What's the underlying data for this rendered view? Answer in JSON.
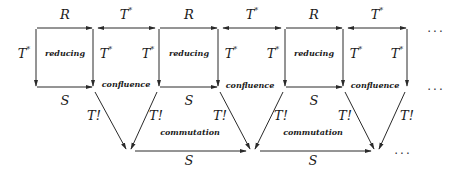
{
  "diagram": {
    "type": "commutative-diagram",
    "colors": {
      "line": "#2a2a2a",
      "background": "#ffffff"
    },
    "labels": {
      "R": "R",
      "S": "S",
      "T_star": "T",
      "star": "*",
      "T_bang": "T!",
      "reducing": "reducing",
      "confluence": "confluence",
      "commutation": "commutation",
      "ellipsis": "..."
    },
    "top_row": [
      "R",
      "T*",
      "R",
      "T*",
      "R",
      "T*",
      "..."
    ],
    "middle_row": [
      "S",
      "S",
      "S",
      "..."
    ],
    "bottom_row": [
      "S",
      "S",
      "..."
    ],
    "regions": [
      "reducing",
      "confluence",
      "reducing",
      "confluence",
      "reducing",
      "confluence",
      "commutation",
      "commutation"
    ]
  }
}
